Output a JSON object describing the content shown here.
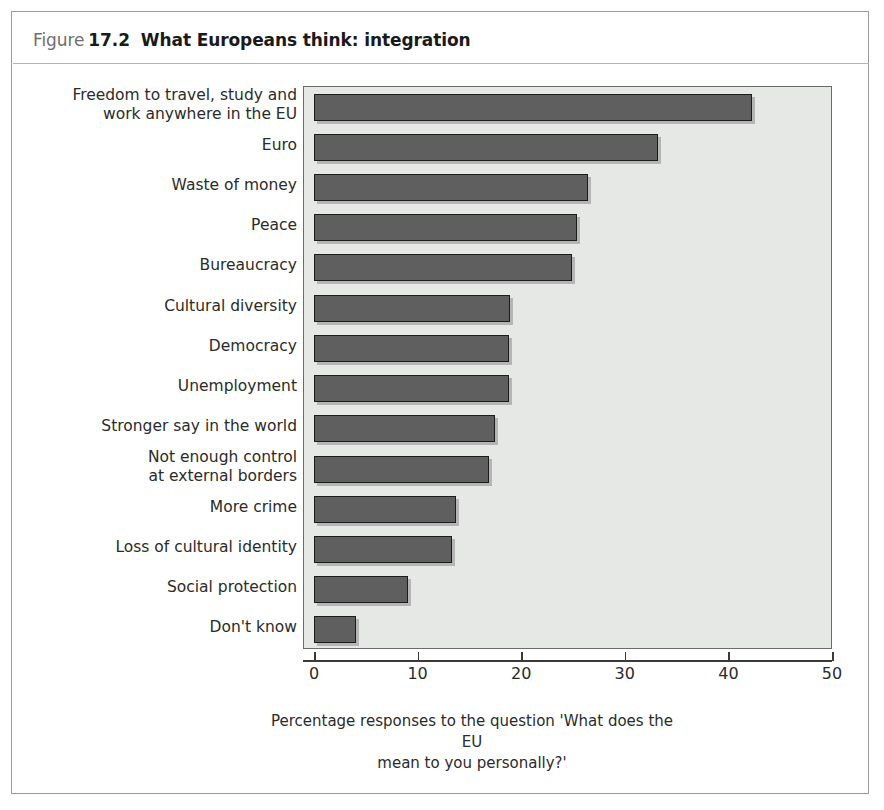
{
  "figure": {
    "label_word": "Figure",
    "number": "17.2",
    "title": "What Europeans think: integration"
  },
  "chart_data": {
    "type": "bar",
    "orientation": "horizontal",
    "title": "What Europeans think: integration",
    "subtitle": "",
    "xlabel": "Percentage responses to the question 'What does the EU mean to you personally?'",
    "ylabel": "",
    "xlim": [
      0,
      50
    ],
    "ticks": [
      0,
      10,
      20,
      30,
      40,
      50
    ],
    "grid": false,
    "legend": null,
    "bar_color": "#5f5f5f",
    "bar_edge_color": "#1c1c1c",
    "plot_background": "#e6e8e6",
    "categories": [
      "Freedom to travel, study and\nwork anywhere in the EU",
      "Euro",
      "Waste of money",
      "Peace",
      "Bureaucracy",
      "Cultural diversity",
      "Democracy",
      "Unemployment",
      "Stronger say in the world",
      "Not enough control\nat external borders",
      "More crime",
      "Loss of cultural identity",
      "Social protection",
      "Don't know"
    ],
    "values": [
      42.3,
      33.2,
      26.4,
      25.4,
      24.9,
      18.9,
      18.8,
      18.8,
      17.5,
      16.9,
      13.7,
      13.3,
      9.1,
      4.1
    ]
  },
  "axis": {
    "tick_labels": [
      "0",
      "10",
      "20",
      "30",
      "40",
      "50"
    ],
    "caption_line1": "Percentage responses to the question 'What does the EU",
    "caption_line2": "mean to you personally?'"
  }
}
